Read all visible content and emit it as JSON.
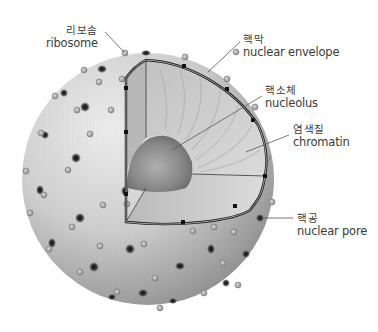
{
  "diagram": {
    "colors": {
      "sphere_light": "#e6e6e6",
      "sphere_dark": "#7d7d7d",
      "interior": "#c9c9c9",
      "nucleolus": "#8a8a8a",
      "envelope_line": "#1a1a1a",
      "leader_line": "#555555",
      "text": "#3a3a3a"
    },
    "labels": [
      {
        "id": "ribosome",
        "korean": "리보솜",
        "english": "ribosome",
        "x": 48,
        "y": 29,
        "align": "right",
        "anchor": [
          124,
          53
        ]
      },
      {
        "id": "nuclear-envelope",
        "korean": "핵막",
        "english": "nuclear envelope",
        "x": 243,
        "y": 37,
        "align": "left",
        "anchor": [
          208,
          72
        ]
      },
      {
        "id": "nucleolus",
        "korean": "핵소체",
        "english": "nucleolus",
        "x": 264,
        "y": 89,
        "align": "left",
        "anchor": [
          172,
          150
        ]
      },
      {
        "id": "chromatin",
        "korean": "염색질",
        "english": "chromatin",
        "x": 293,
        "y": 128,
        "align": "left",
        "anchor": [
          246,
          152
        ]
      },
      {
        "id": "nuclear-pore",
        "korean": "핵공",
        "english": "nuclear pore",
        "x": 297,
        "y": 212,
        "align": "left",
        "anchor": [
          262,
          218
        ]
      }
    ]
  }
}
